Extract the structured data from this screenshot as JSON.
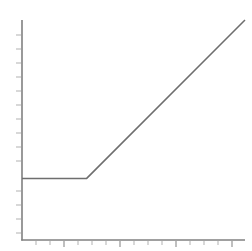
{
  "figure": {
    "width": 252,
    "height": 251,
    "background_color": "#ffffff",
    "title": "",
    "caption": ""
  },
  "style": {
    "axis_color": "#808080",
    "tick_color": "#8a8a8a",
    "minor_tick_color": "#a8a8a8",
    "line_color": "#6e6e6e"
  },
  "chart_data": {
    "type": "line",
    "title": "",
    "subtitle": "",
    "xlabel": "",
    "ylabel": "",
    "grid": false,
    "legend": [],
    "legend_position": "none",
    "annotations": [],
    "xlim": [
      0,
      100
    ],
    "ylim": [
      0,
      100
    ],
    "xticks": [],
    "yticks": [],
    "xticklabels": [],
    "yticklabels": [],
    "series": [
      {
        "name": "curve",
        "x": [
          0,
          29,
          100
        ],
        "y": [
          28,
          28,
          100
        ],
        "color": "#6e6e6e",
        "linewidth": 1.5,
        "marker": "none"
      }
    ],
    "breakpoint": {
      "x": 29,
      "y": 28
    },
    "segments": [
      {
        "name": "flat-segment",
        "slope": 0,
        "x_start": 0,
        "x_end": 29,
        "y_start": 28,
        "y_end": 28
      },
      {
        "name": "rising-segment",
        "slope": 1.014,
        "x_start": 29,
        "x_end": 100,
        "y_start": 28,
        "y_end": 100
      }
    ],
    "axes_pixels": {
      "x_axis_y": 240,
      "y_axis_x": 22,
      "plot_left": 22,
      "plot_right": 245,
      "plot_top": 20,
      "plot_bottom": 240
    },
    "y_minor_tick_pixels": [
      35,
      49,
      63,
      77,
      91,
      105,
      119,
      133,
      147,
      161,
      177,
      191,
      205,
      219,
      233
    ],
    "x_minor_tick_pixels": [
      36,
      50,
      64,
      78,
      92,
      106,
      120,
      134,
      148,
      162,
      176,
      190,
      204,
      218,
      232
    ],
    "x_major_tick_pixels": [
      64,
      120,
      176,
      232
    ]
  }
}
